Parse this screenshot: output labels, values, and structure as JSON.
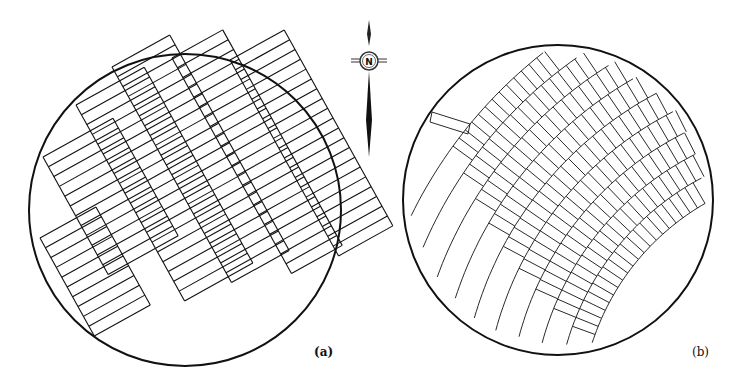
{
  "figure": {
    "panels": [
      {
        "id": "a",
        "label": "(a)",
        "description": "Circular field with straight rectangular strip grid, rotated"
      },
      {
        "id": "b",
        "label": "(b)",
        "description": "Circular field with curved (fan-shaped) strip grid"
      }
    ],
    "compass": {
      "letter": "N",
      "icon": "north-arrow-icon"
    },
    "colors": {
      "line": "#111111",
      "background": "#ffffff"
    }
  }
}
